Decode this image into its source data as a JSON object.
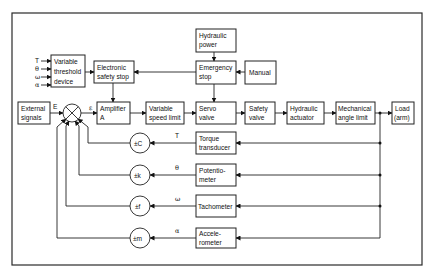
{
  "diagram": {
    "blocks": {
      "hydraulic_power": [
        "Hydraulic",
        "power"
      ],
      "emergency_stop": [
        "Emergency",
        "stop"
      ],
      "manual": [
        "Manual"
      ],
      "variable_threshold": [
        "Variable",
        "threshold",
        "device"
      ],
      "electronic_safety_stop": [
        "Electronic",
        "safety stop"
      ],
      "external_signals": [
        "External",
        "signals"
      ],
      "amplifier": [
        "Amplifier",
        "A"
      ],
      "variable_speed_limit": [
        "Variable",
        "speed limit"
      ],
      "servo_valve": [
        "Servo",
        "valve"
      ],
      "safety_valve": [
        "Safety",
        "valve"
      ],
      "hydraulic_actuator": [
        "Hydraulic",
        "actuator"
      ],
      "mechanical_angle_limit": [
        "Mechanical",
        "angle limit"
      ],
      "load": [
        "Load",
        "(arm)"
      ],
      "torque_transducer": [
        "Torque",
        "transducer"
      ],
      "potentiometer": [
        "Potentio-",
        "meter"
      ],
      "tachometer": [
        "Tachometer"
      ],
      "accelerometer": [
        "Accele-",
        "rometer"
      ]
    },
    "gains": [
      "±C",
      "±k",
      "±f",
      "±m"
    ],
    "signal_labels": {
      "E": "E",
      "epsilon": "ε",
      "T": "T",
      "theta": "θ",
      "omega": "ω",
      "alpha": "α"
    },
    "threshold_inputs": [
      "T",
      "θ",
      "ω",
      "α"
    ]
  }
}
